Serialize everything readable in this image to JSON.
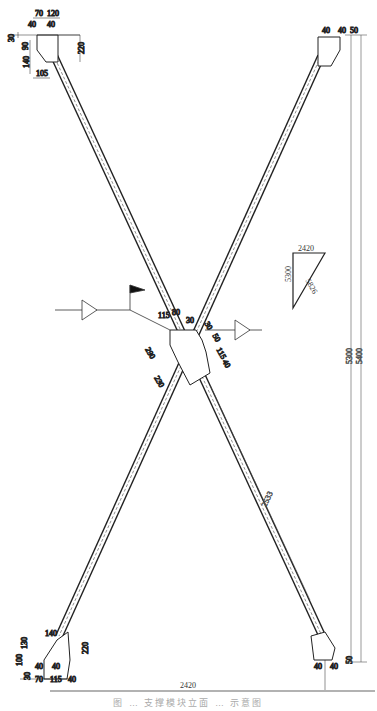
{
  "drawing": {
    "type": "X-brace steel connection elevation",
    "overall": {
      "width_label": "2420",
      "height_outer_label": "5400",
      "height_inner_label": "5300",
      "brace_length_label": "2533"
    },
    "slope_triangle": {
      "horizontal": "2420",
      "vertical": "5300",
      "hypotenuse": "5826"
    },
    "top_left_gusset": {
      "dims": [
        "70",
        "120",
        "40",
        "40",
        "30",
        "90",
        "140",
        "105",
        "220"
      ]
    },
    "top_right_gusset": {
      "dims": [
        "40",
        "40",
        "50"
      ]
    },
    "center_gusset": {
      "dims": [
        "115",
        "80",
        "30",
        "290",
        "230",
        "30",
        "50",
        "115",
        "40"
      ]
    },
    "bottom_left_gusset": {
      "dims": [
        "140",
        "130",
        "100",
        "30",
        "40",
        "40",
        "70",
        "115",
        "40",
        "220"
      ]
    },
    "bottom_right_gusset": {
      "dims": [
        "40",
        "40",
        "50"
      ]
    },
    "section_markers": [
      "left-section-flag",
      "right-section-triangle"
    ],
    "caption": "图 … 支撑模块立面 … 示意图"
  }
}
